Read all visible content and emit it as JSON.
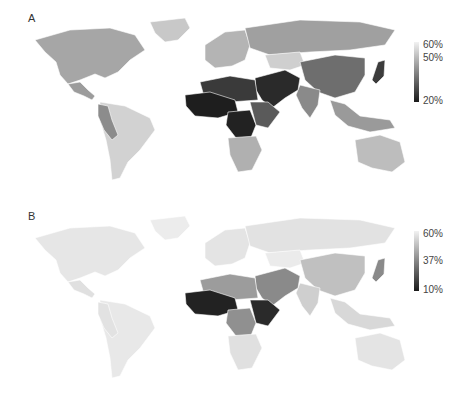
{
  "panels": [
    {
      "label": "A",
      "legend": {
        "ticks": [
          "60%",
          "50%",
          "20%"
        ],
        "max_color": "#f2f2f2",
        "min_color": "#1a1a1a"
      }
    },
    {
      "label": "B",
      "legend": {
        "ticks": [
          "60%",
          "37%",
          "10%"
        ],
        "max_color": "#f2f2f2",
        "min_color": "#1a1a1a"
      }
    }
  ],
  "colors": {
    "A": {
      "north_america": "#a6a6a6",
      "greenland": "#c8c8c8",
      "central_america": "#9c9c9c",
      "south_america": "#d2d2d2",
      "andes": "#8c8c8c",
      "europe": "#b4b4b4",
      "russia": "#a0a0a0",
      "central_asia": "#cfcfcf",
      "china": "#6e6e6e",
      "india": "#8a8a8a",
      "middle_east": "#2a2a2a",
      "north_africa": "#3a3a3a",
      "west_africa": "#1e1e1e",
      "central_africa": "#222222",
      "east_africa": "#5a5a5a",
      "southern_africa": "#b0b0b0",
      "se_asia": "#9a9a9a",
      "australia": "#bdbdbd",
      "japan": "#3c3c3c"
    },
    "B": {
      "north_america": "#e6e6e6",
      "greenland": "#ececec",
      "central_america": "#e0e0e0",
      "south_america": "#e8e8e8",
      "andes": "#e2e2e2",
      "europe": "#e4e4e4",
      "russia": "#e2e2e2",
      "central_asia": "#ebebeb",
      "china": "#c0c0c0",
      "india": "#cfcfcf",
      "middle_east": "#8a8a8a",
      "north_africa": "#9c9c9c",
      "west_africa": "#222222",
      "central_africa": "#909090",
      "east_africa": "#2a2a2a",
      "southern_africa": "#e0e0e0",
      "se_asia": "#d8d8d8",
      "australia": "#e4e4e4",
      "japan": "#8a8a8a"
    }
  }
}
